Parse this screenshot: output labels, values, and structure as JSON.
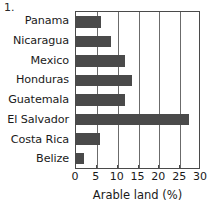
{
  "figure": {
    "number_label": "1."
  },
  "chart_data": {
    "type": "bar",
    "orientation": "horizontal",
    "title": "",
    "subtitle": "",
    "xlabel": "Arable land (%)",
    "ylabel": "",
    "categories": [
      "Panama",
      "Nicaragua",
      "Mexico",
      "Honduras",
      "Guatemala",
      "El Salvador",
      "Costa Rica",
      "Belize"
    ],
    "values": [
      6.0,
      8.5,
      11.8,
      13.5,
      11.8,
      27.0,
      5.8,
      2.0
    ],
    "xlim": [
      0,
      30
    ],
    "ylim": null,
    "xticks": [
      0,
      5,
      10,
      15,
      20,
      25,
      30
    ],
    "xtick_labels": [
      "0",
      "5",
      "10",
      "15",
      "20",
      "25",
      "30"
    ],
    "grid": true,
    "grid_axis": "x",
    "legend": false,
    "legend_position": "none",
    "bar_color": "#4a4a4a",
    "axis_color": "#4a4a4a",
    "grid_color": "#6b6b6b",
    "background_color": "#ffffff"
  }
}
